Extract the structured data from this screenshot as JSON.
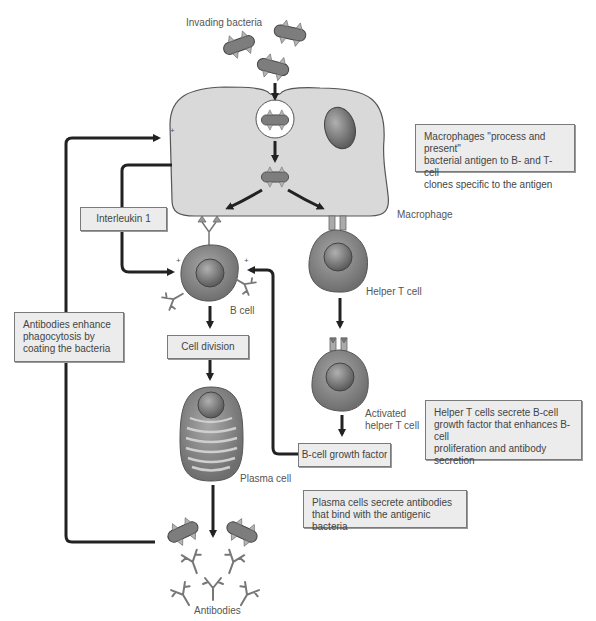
{
  "diagram": {
    "labels": {
      "invading_bacteria": "Invading bacteria",
      "macrophage": "Macrophage",
      "b_cell": "B cell",
      "helper_t_cell": "Helper T cell",
      "activated_helper_t_cell": "Activated\nhelper T cell",
      "plasma_cell": "Plasma cell",
      "antibodies": "Antibodies"
    },
    "boxes": {
      "interleukin": "Interleukin 1",
      "cell_division": "Cell division",
      "b_cell_growth_factor": "B-cell growth factor"
    },
    "notes": {
      "macrophages": "Macrophages \"process and present\"\nbacterial antigen to B- and T-cell\nclones specific to the antigen",
      "antibodies_enhance": "Antibodies enhance\nphagocytosis by\ncoating the bacteria",
      "helper_t_cells": "Helper T cells secrete B-cell\ngrowth factor that enhances B-cell\nproliferation and antibody\nsecretion",
      "plasma_cells": "Plasma cells secrete antibodies\nthat bind with the antigenic bacteria"
    },
    "plus_sign": "+",
    "colors": {
      "macrophage_fill": "#d9d9d9",
      "cell_fill": "#8a8a8a",
      "bacteria_fill": "#7d7d7d",
      "arrow": "#222222",
      "box_fill": "#ececec"
    }
  }
}
